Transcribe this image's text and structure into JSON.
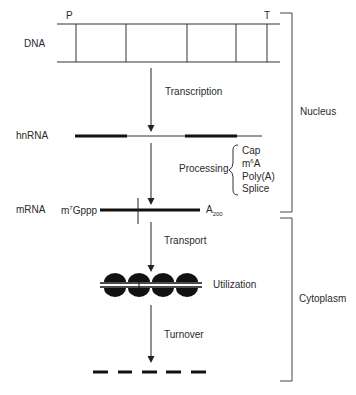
{
  "diagram": {
    "title": "",
    "stages": {
      "dna": {
        "label": "DNA",
        "promoter_label": "P",
        "terminator_label": "T"
      },
      "hnrna": {
        "label": "hnRNA"
      },
      "mrna": {
        "label": "mRNA",
        "cap_prefix": "m",
        "cap_sup": "7",
        "cap_suffix": "Gppp",
        "tail_base": "A",
        "tail_sub": "200"
      }
    },
    "steps": {
      "transcription": "Transcription",
      "processing": "Processing",
      "transport": "Transport",
      "utilization": "Utilization",
      "turnover": "Turnover"
    },
    "processing_items": {
      "cap": "Cap",
      "m6a_prefix": "m",
      "m6a_sup": "6",
      "m6a_suffix": "A",
      "polya": "Poly(A)",
      "splice": "Splice"
    },
    "compartments": {
      "nucleus": "Nucleus",
      "cytoplasm": "Cytoplasm"
    }
  }
}
